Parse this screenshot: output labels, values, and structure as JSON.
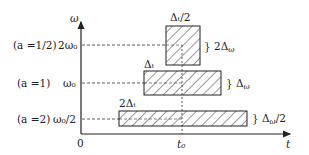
{
  "diagram": {
    "axes": {
      "y_label": "ω",
      "x_label": "t",
      "origin_label": "0",
      "t0_label": "t₀"
    },
    "rows": [
      {
        "scale_label": "(a =1/2)",
        "freq_label": "2ω₀",
        "width_label": "Δₜ/2",
        "height_label": "} 2Δ_ω",
        "height_label_main": "} 2Δ",
        "height_label_sub": "ω"
      },
      {
        "scale_label": "(a =1)",
        "freq_label": "ω₀",
        "width_label": "Δₜ",
        "height_label": "} Δ_ω",
        "height_label_main": "} Δ",
        "height_label_sub": "ω"
      },
      {
        "scale_label": "(a =2)",
        "freq_label": "ω₀/2",
        "width_label": "2Δₜ",
        "height_label": "} Δ_ω/2",
        "height_label_main": "} Δ",
        "height_label_sub": "ω",
        "height_label_tail": "/2"
      }
    ],
    "colors": {
      "line": "#222222",
      "hatch": "#333333",
      "background": "#ffffff"
    }
  }
}
